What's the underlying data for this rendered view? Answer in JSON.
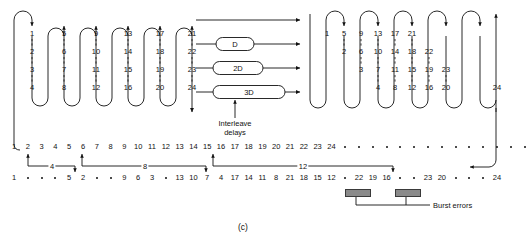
{
  "figure": {
    "caption": "(c)",
    "interleave_label_line1": "Interleave",
    "interleave_label_line2": "delays",
    "burst_label": "Burst errors"
  },
  "delay_boxes": [
    {
      "name": "no-delay",
      "label": ""
    },
    {
      "name": "delay-d",
      "label": "D"
    },
    {
      "name": "delay-2d",
      "label": "2D"
    },
    {
      "name": "delay-3d",
      "label": "3D"
    }
  ],
  "interleaver": {
    "columns": [
      {
        "values": [
          "1",
          "2",
          "3",
          "4"
        ]
      },
      {
        "values": [
          "5",
          "6",
          "7",
          "8"
        ]
      },
      {
        "values": [
          "9",
          "10",
          "11",
          "12"
        ]
      },
      {
        "values": [
          "13",
          "14",
          "15",
          "16"
        ]
      },
      {
        "values": [
          "17",
          "18",
          "19",
          "20"
        ]
      },
      {
        "values": [
          "21",
          "22",
          "23",
          "24"
        ]
      }
    ]
  },
  "deinterleaver": {
    "columns": [
      {
        "values": [
          "1"
        ]
      },
      {
        "values": [
          "5",
          "2"
        ]
      },
      {
        "values": [
          "9",
          "6",
          "3"
        ]
      },
      {
        "values": [
          "13",
          "10",
          "7",
          "4"
        ]
      },
      {
        "values": [
          "17",
          "14",
          "11",
          "8"
        ]
      },
      {
        "values": [
          "21",
          "18",
          "15",
          "12"
        ]
      },
      {
        "values": [
          "22",
          "19",
          "16"
        ]
      },
      {
        "values": [
          "23",
          "20"
        ]
      },
      {
        "values": [
          "24"
        ]
      }
    ]
  },
  "row_top": {
    "items": [
      "1",
      "2",
      "3",
      "4",
      "5",
      "6",
      "7",
      "8",
      "9",
      "10",
      "11",
      "12",
      "13",
      "14",
      "15",
      "16",
      "17",
      "18",
      "19",
      "20",
      "21",
      "22",
      "23",
      "24",
      ".",
      ".",
      ".",
      ".",
      ".",
      ".",
      ".",
      ".",
      ".",
      ".",
      ".",
      ".",
      ".",
      "."
    ]
  },
  "row_bottom": {
    "items": [
      "1",
      ".",
      ".",
      ".",
      "5",
      "2",
      ".",
      ".",
      "9",
      "6",
      "3",
      ".",
      "13",
      "10",
      "7",
      "4",
      "17",
      "14",
      "11",
      "8",
      "21",
      "18",
      "15",
      "12",
      ".",
      "22",
      "19",
      "16",
      ".",
      ".",
      "23",
      "20",
      ".",
      ".",
      ".",
      "24"
    ]
  },
  "span_labels": [
    "4",
    "8",
    "12"
  ]
}
